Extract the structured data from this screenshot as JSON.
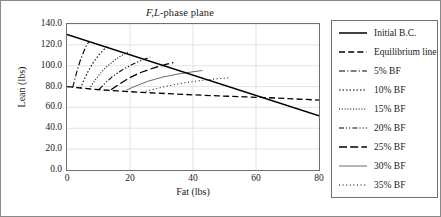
{
  "chart_data": {
    "type": "line",
    "title": "F,L-phase plane",
    "title_italic_prefix": "F,L",
    "title_rest": "-phase plane",
    "xlabel": "Fat (lbs)",
    "ylabel": "Lean (lbs)",
    "xlim": [
      0,
      80
    ],
    "ylim": [
      0,
      140
    ],
    "xticks": [
      0,
      20,
      40,
      60,
      80
    ],
    "xticklabels": [
      "0",
      "20",
      "40",
      "60",
      "80"
    ],
    "yticks": [
      0,
      20,
      40,
      60,
      80,
      100,
      120,
      140
    ],
    "yticklabels": [
      "0.0",
      "20.0",
      "40.0",
      "60.0",
      "80.0",
      "100.0",
      "120.0",
      "140.0"
    ],
    "grid": true,
    "legend_position": "right-outside",
    "series": [
      {
        "name": "Initial B.C.",
        "style": "solid",
        "color": "#000000",
        "width": 1.5,
        "points": [
          [
            0,
            130
          ],
          [
            80,
            52
          ]
        ]
      },
      {
        "name": "Equilibrium line",
        "style": "dashed",
        "color": "#000000",
        "width": 1.3,
        "points": [
          [
            0,
            80
          ],
          [
            8,
            77.5
          ],
          [
            16,
            75.8
          ],
          [
            24,
            74.4
          ],
          [
            32,
            73.2
          ],
          [
            40,
            72.1
          ],
          [
            48,
            71.1
          ],
          [
            56,
            70.2
          ],
          [
            64,
            69.3
          ],
          [
            72,
            68.2
          ],
          [
            80,
            67
          ]
        ]
      },
      {
        "name": "5% BF",
        "style": "dashdot",
        "color": "#000000",
        "width": 1.1,
        "points": [
          [
            1.8,
            79
          ],
          [
            2.4,
            86
          ],
          [
            3.2,
            95
          ],
          [
            4.1,
            104
          ],
          [
            5.1,
            112
          ],
          [
            6.1,
            119
          ],
          [
            7.0,
            123.2
          ]
        ]
      },
      {
        "name": "10% BF",
        "style": "dotted",
        "color": "#000000",
        "width": 1.1,
        "points": [
          [
            4.2,
            78.2
          ],
          [
            5.2,
            85
          ],
          [
            6.6,
            94
          ],
          [
            8.2,
            102.5
          ],
          [
            10.0,
            110
          ],
          [
            11.8,
            115.8
          ],
          [
            13.2,
            118.8
          ]
        ]
      },
      {
        "name": "15% BF",
        "style": "dotted-fine",
        "color": "#000000",
        "width": 1.1,
        "points": [
          [
            7.0,
            77.6
          ],
          [
            8.4,
            84
          ],
          [
            10.4,
            92
          ],
          [
            12.8,
            99.5
          ],
          [
            15.4,
            106
          ],
          [
            17.8,
            110.6
          ],
          [
            19.4,
            113.2
          ]
        ]
      },
      {
        "name": "20% BF",
        "style": "dashdotdot",
        "color": "#000000",
        "width": 1.1,
        "points": [
          [
            10.2,
            77.2
          ],
          [
            12.0,
            83
          ],
          [
            14.6,
            90
          ],
          [
            17.8,
            96.5
          ],
          [
            21.2,
            102
          ],
          [
            24.4,
            106
          ],
          [
            26.4,
            108.2
          ]
        ]
      },
      {
        "name": "25% BF",
        "style": "longdash",
        "color": "#000000",
        "width": 1.3,
        "points": [
          [
            14.0,
            76.9
          ],
          [
            16.4,
            82
          ],
          [
            19.6,
            88
          ],
          [
            23.4,
            93.5
          ],
          [
            27.6,
            98
          ],
          [
            31.4,
            101.2
          ],
          [
            33.8,
            103
          ]
        ]
      },
      {
        "name": "30% BF",
        "style": "solid-thin",
        "color": "#6b6b6b",
        "width": 1.0,
        "points": [
          [
            18.8,
            76.5
          ],
          [
            21.8,
            80.5
          ],
          [
            25.6,
            85
          ],
          [
            30.2,
            89
          ],
          [
            35.2,
            92
          ],
          [
            40.0,
            94.2
          ],
          [
            43.0,
            95.4
          ]
        ]
      },
      {
        "name": "35% BF",
        "style": "dotted-sparse",
        "color": "#000000",
        "width": 1.0,
        "points": [
          [
            25.0,
            75.5
          ],
          [
            28.4,
            78
          ],
          [
            32.6,
            81
          ],
          [
            37.6,
            83.8
          ],
          [
            43.0,
            86
          ],
          [
            48.2,
            87.6
          ],
          [
            51.4,
            88.4
          ]
        ]
      }
    ]
  },
  "legend": {
    "items": [
      {
        "label": "Initial B.C."
      },
      {
        "label": "Equilibrium line"
      },
      {
        "label": "5% BF"
      },
      {
        "label": "10% BF"
      },
      {
        "label": "15% BF"
      },
      {
        "label": "20% BF"
      },
      {
        "label": "25% BF"
      },
      {
        "label": "30% BF"
      },
      {
        "label": "35% BF"
      }
    ]
  }
}
